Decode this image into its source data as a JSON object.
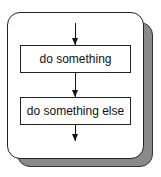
{
  "diagram": {
    "type": "flowchart",
    "container": {
      "style": "rounded card with drop shadow",
      "shadow_color": "#8a8a8a",
      "border_color": "#222222"
    },
    "steps": [
      {
        "label": "do something"
      },
      {
        "label": "do something else"
      }
    ],
    "arrows": [
      {
        "from": "entry",
        "to": "step-1"
      },
      {
        "from": "step-1",
        "to": "step-2"
      },
      {
        "from": "step-2",
        "to": "exit"
      }
    ]
  }
}
